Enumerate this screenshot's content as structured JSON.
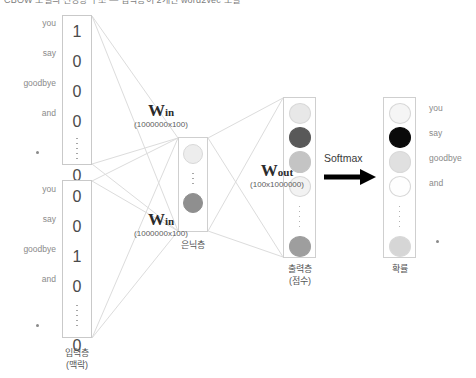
{
  "title": "CBOW 모델의 신경망 구조 — 입력층이 2개인 word2vec 모델",
  "diagram": {
    "type": "neural-network",
    "input_layer": {
      "caption_line1": "입력층",
      "caption_line2": "(맥락)",
      "word_labels": [
        "you",
        "say",
        "goodbye",
        "and"
      ],
      "ellipsis_label": "·",
      "vectors": [
        {
          "name": "context-vector-1",
          "values": [
            "1",
            "0",
            "0",
            "0"
          ],
          "has_ellipsis": true,
          "tail_value": "0"
        },
        {
          "name": "context-vector-2",
          "values": [
            "0",
            "0",
            "1",
            "0"
          ],
          "has_ellipsis": true,
          "tail_value": "0"
        }
      ]
    },
    "weights_in": [
      {
        "symbol": "W",
        "subscript": "in",
        "dims": "(1000000x100)"
      },
      {
        "symbol": "W",
        "subscript": "in",
        "dims": "(1000000x100)"
      }
    ],
    "hidden_layer": {
      "caption_line1": "은닉층",
      "caption_line2": "",
      "nodes": [
        "#ededed",
        "#8f8f8f"
      ],
      "has_ellipsis": true
    },
    "weights_out": {
      "symbol": "W",
      "subscript": "out",
      "dims": "(100x1000000)"
    },
    "output_layer": {
      "caption_line1": "출력층",
      "caption_line2": "(점수)",
      "nodes": [
        "#e8e8e8",
        "#595959",
        "#c4c4c4",
        "#f2f2f2"
      ],
      "has_ellipsis": true,
      "tail_node": "#9e9e9e"
    },
    "softmax": {
      "label": "Softmax",
      "arrow": "right-arrow"
    },
    "probability_layer": {
      "caption_line1": "확률",
      "caption_line2": "",
      "nodes": [
        "#f5f5f5",
        "#0a0a0a",
        "#e0e0e0",
        "#fefefe"
      ],
      "has_ellipsis": true,
      "tail_node": "#d6d6d6",
      "word_labels": [
        "you",
        "say",
        "goodbye",
        "and"
      ],
      "ellipsis_label": "·"
    },
    "colors": {
      "box_border": "#c9c9c9",
      "connector_line": "#dcdcdc",
      "text": "#6b6b6b",
      "arrow": "#000000"
    }
  }
}
